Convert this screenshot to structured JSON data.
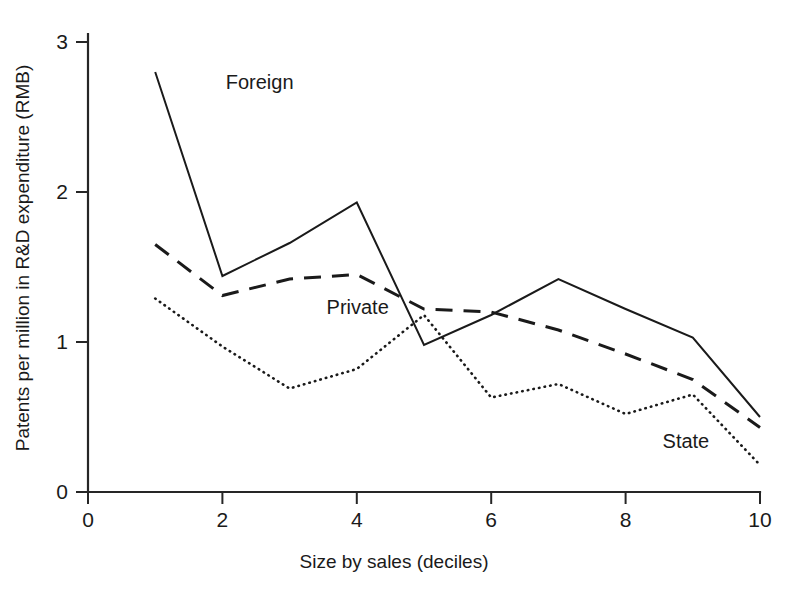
{
  "chart_data": {
    "type": "line",
    "title": "",
    "xlabel": "Size by sales (deciles)",
    "ylabel": "Patents per million in R&D expenditure (RMB)",
    "x": [
      1,
      2,
      3,
      4,
      5,
      6,
      7,
      8,
      9,
      10
    ],
    "xlim": [
      0,
      10
    ],
    "ylim": [
      0,
      3
    ],
    "xticks": [
      "0",
      "2",
      "4",
      "6",
      "8",
      "10"
    ],
    "xtick_values": [
      0,
      2,
      4,
      6,
      8,
      10
    ],
    "yticks": [
      "0",
      "1",
      "2",
      "3"
    ],
    "ytick_values": [
      0,
      1,
      2,
      3
    ],
    "grid": false,
    "legend": "inline-annotations",
    "series": [
      {
        "name": "Foreign",
        "style": "solid",
        "color": "#1a1a1a",
        "values": [
          2.8,
          1.44,
          1.66,
          1.93,
          0.98,
          1.18,
          1.42,
          1.22,
          1.03,
          0.5
        ],
        "label_x": 2.05,
        "label_y": 2.72
      },
      {
        "name": "Private",
        "style": "dashed",
        "color": "#1a1a1a",
        "values": [
          1.65,
          1.31,
          1.42,
          1.45,
          1.22,
          1.2,
          1.08,
          0.92,
          0.75,
          0.43
        ],
        "label_x": 3.55,
        "label_y": 1.22
      },
      {
        "name": "State",
        "style": "dotted",
        "color": "#1a1a1a",
        "values": [
          1.29,
          0.97,
          0.69,
          0.82,
          1.18,
          0.63,
          0.72,
          0.52,
          0.65,
          0.18
        ],
        "label_x": 8.55,
        "label_y": 0.33
      }
    ]
  },
  "axes": {
    "x_title": "Size by sales (deciles)",
    "y_title": "Patents per million in R&D expenditure (RMB)"
  }
}
